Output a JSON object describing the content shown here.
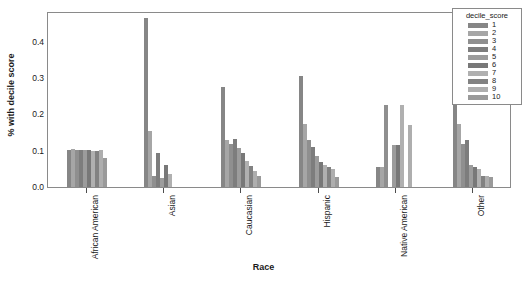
{
  "chart_data": {
    "type": "bar",
    "title": "",
    "xlabel": "Race",
    "ylabel": "% with decile score",
    "ylim": [
      0.0,
      0.48
    ],
    "ytick_labels": [
      "0.0",
      "0.1",
      "0.2",
      "0.3",
      "0.4"
    ],
    "ytick_values": [
      0.0,
      0.1,
      0.2,
      0.3,
      0.4
    ],
    "grid": false,
    "legend_title": "decile_score",
    "legend_position": "top-right",
    "categories": [
      "African American",
      "Asian",
      "Caucasian",
      "Hispanic",
      "Native American",
      "Other"
    ],
    "series": [
      {
        "name": "1",
        "color": "#868686",
        "values": [
          0.102,
          0.465,
          0.275,
          0.305,
          0.055,
          0.4
        ]
      },
      {
        "name": "2",
        "color": "#a6a6a6",
        "values": [
          0.104,
          0.155,
          0.13,
          0.175,
          0.055,
          0.175
        ]
      },
      {
        "name": "3",
        "color": "#8f8f8f",
        "values": [
          0.101,
          0.03,
          0.12,
          0.13,
          0.225,
          0.12
        ]
      },
      {
        "name": "4",
        "color": "#7d7d7d",
        "values": [
          0.103,
          0.095,
          0.133,
          0.11,
          0.0,
          0.13
        ]
      },
      {
        "name": "5",
        "color": "#9c9c9c",
        "values": [
          0.103,
          0.025,
          0.108,
          0.085,
          0.115,
          0.06
        ]
      },
      {
        "name": "6",
        "color": "#787878",
        "values": [
          0.102,
          0.06,
          0.095,
          0.07,
          0.115,
          0.055
        ]
      },
      {
        "name": "7",
        "color": "#b0b0b0",
        "values": [
          0.1,
          0.035,
          0.072,
          0.06,
          0.225,
          0.05
        ]
      },
      {
        "name": "8",
        "color": "#828282",
        "values": [
          0.099,
          0.0,
          0.057,
          0.055,
          0.0,
          0.03
        ]
      },
      {
        "name": "9",
        "color": "#aeaeae",
        "values": [
          0.103,
          0.0,
          0.045,
          0.05,
          0.17,
          0.03
        ]
      },
      {
        "name": "10",
        "color": "#9a9a9a",
        "values": [
          0.081,
          0.0,
          0.03,
          0.028,
          0.0,
          0.028
        ]
      }
    ]
  },
  "axes": {
    "panel_border_color": "#8a8a8a",
    "tick_color": "#4d4d4d",
    "text_color": "#1a1a1a"
  }
}
